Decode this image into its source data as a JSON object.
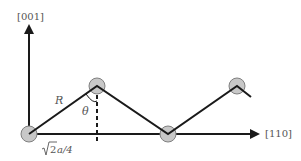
{
  "diagram": {
    "axes": {
      "vertical": {
        "label": "[001]"
      },
      "horizontal": {
        "label": "[110]"
      }
    },
    "labels": {
      "bond_length": "R",
      "angle": "θ",
      "half_spacing_radicand": "2",
      "half_spacing_rest": "a/4"
    },
    "atoms": [
      {
        "x": 29,
        "y": 134
      },
      {
        "x": 97,
        "y": 86
      },
      {
        "x": 168,
        "y": 134
      },
      {
        "x": 237,
        "y": 86
      }
    ],
    "colors": {
      "atom_fill": "#c8c8c8",
      "atom_stroke": "#808080",
      "line": "#1a1a1a",
      "text": "#555555"
    }
  }
}
